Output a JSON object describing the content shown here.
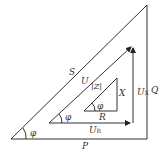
{
  "diagram": {
    "outer_triangle": {
      "hyp": "S",
      "vert": "Q",
      "base": "P",
      "angle": "φ"
    },
    "voltage_triangle": {
      "hyp": "U",
      "vert": "U",
      "vert_sub": "X",
      "base": "U",
      "base_sub": "R",
      "angle": "φ"
    },
    "impedance_triangle": {
      "hyp": "|Z|",
      "vert": "X",
      "base": "R",
      "angle": "φ"
    }
  }
}
